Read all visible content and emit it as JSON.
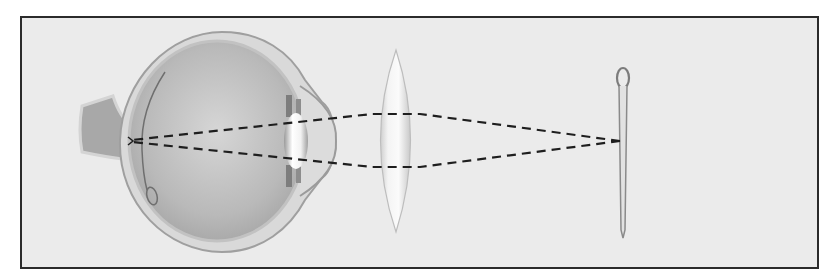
{
  "figure": {
    "elements": [
      {
        "id": "eye",
        "label": "eye cross-section (side view)"
      },
      {
        "id": "optic-nerve",
        "label": "optic nerve"
      },
      {
        "id": "retina",
        "label": "retina"
      },
      {
        "id": "eye-lens",
        "label": "crystalline lens"
      },
      {
        "id": "cornea",
        "label": "cornea"
      },
      {
        "id": "convex-lens",
        "label": "biconvex lens"
      },
      {
        "id": "needle",
        "label": "needle (object)"
      },
      {
        "id": "light-rays",
        "label": "dashed light rays"
      }
    ],
    "colors": {
      "frame_border": "#2b2b2b",
      "background": "#ebebeb",
      "eye_outer": "#c9c9c9",
      "eye_inner": "#b5b5b5",
      "lens_fill": "#f7f7f7",
      "ray": "#1e1e1e",
      "needle": "#8a8a8a"
    }
  }
}
